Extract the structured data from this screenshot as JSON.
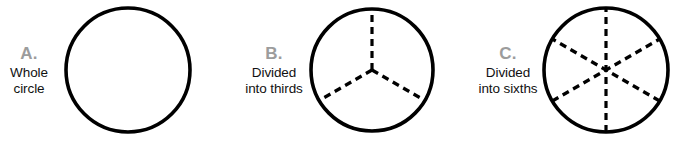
{
  "figure": {
    "background_color": "#ffffff",
    "stroke_color": "#000000",
    "letter_color": "#9c9c9c",
    "caption_color": "#111111",
    "panels": [
      {
        "letter": "A.",
        "caption": "Whole\ncircle",
        "icon_name": "whole-circle-diagram",
        "circle": {
          "cx": 64,
          "cy": 70,
          "r": 62,
          "stroke_width": 3.6,
          "divisions": 1,
          "division_type": "none",
          "dashes": []
        }
      },
      {
        "letter": "B.",
        "caption": "Divided\ninto thirds",
        "icon_name": "circle-divided-into-thirds-diagram",
        "circle": {
          "cx": 62,
          "cy": 70,
          "r": 61,
          "stroke_width": 3.6,
          "divisions": 3,
          "division_type": "radii",
          "dashes": [
            {
              "angle_deg": 90,
              "kind": "radius"
            },
            {
              "angle_deg": 210,
              "kind": "radius"
            },
            {
              "angle_deg": 330,
              "kind": "radius"
            }
          ]
        }
      },
      {
        "letter": "C.",
        "caption": "Divided\ninto sixths",
        "icon_name": "circle-divided-into-sixths-diagram",
        "circle": {
          "cx": 64,
          "cy": 70,
          "r": 62,
          "stroke_width": 3.6,
          "divisions": 6,
          "division_type": "diameters",
          "dashes": [
            {
              "angle_deg": 90,
              "kind": "diameter"
            },
            {
              "angle_deg": 30,
              "kind": "diameter"
            },
            {
              "angle_deg": 150,
              "kind": "diameter"
            }
          ]
        }
      }
    ],
    "dash_pattern": "7 5"
  }
}
